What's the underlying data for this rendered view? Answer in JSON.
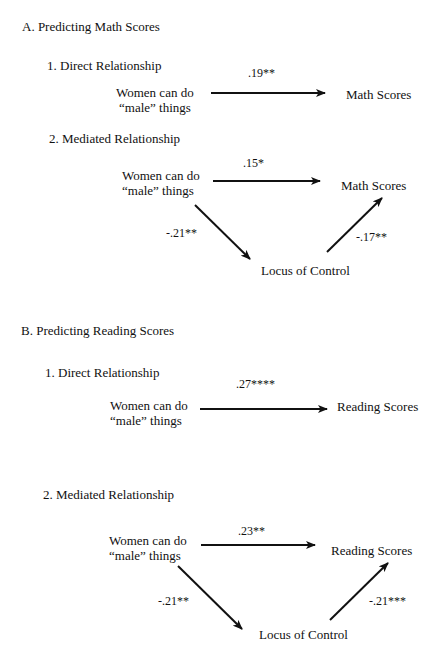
{
  "sections": [
    {
      "title": "A.  Predicting Math Scores",
      "direct": {
        "heading": "1.  Direct Relationship",
        "predictor_line1": "Women can do",
        "predictor_line2": "“male” things",
        "outcome": "Math Scores",
        "coef": ".19**"
      },
      "mediated": {
        "heading": "2.  Mediated Relationship",
        "predictor_line1": "Women can do",
        "predictor_line2": "“male” things",
        "outcome": "Math Scores",
        "mediator": "Locus of Control",
        "coef_direct": ".15*",
        "coef_a": "-.21**",
        "coef_b": "-.17**"
      }
    },
    {
      "title": "B.  Predicting Reading Scores",
      "direct": {
        "heading": "1.  Direct Relationship",
        "predictor_line1": "Women can do",
        "predictor_line2": "“male” things",
        "outcome": "Reading Scores",
        "coef": ".27****"
      },
      "mediated": {
        "heading": "2.  Mediated Relationship",
        "predictor_line1": "Women can do",
        "predictor_line2": "“male” things",
        "outcome": "Reading Scores",
        "mediator": "Locus of Control",
        "coef_direct": ".23**",
        "coef_a": "-.21**",
        "coef_b": "-.21***"
      }
    }
  ]
}
